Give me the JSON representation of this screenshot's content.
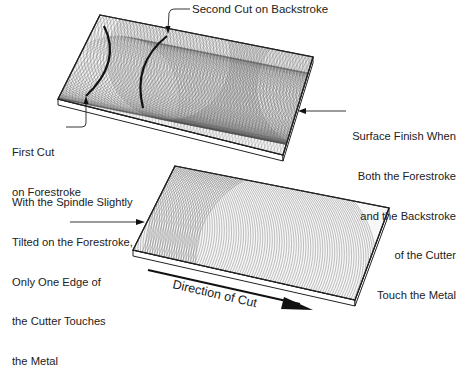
{
  "figure": {
    "top_panel": {
      "labels": {
        "second_cut": "Second Cut on Backstroke",
        "first_cut": [
          "First Cut",
          "on Forestroke"
        ],
        "surface_finish": [
          "Surface Finish When",
          "Both the Forestroke",
          "and the Backstroke",
          "of the Cutter",
          "Touch the Metal"
        ]
      }
    },
    "bottom_panel": {
      "labels": {
        "tilted_spindle": [
          "With the Spindle Slightly",
          "Tilted on the Forestroke,",
          "Only One Edge of",
          "the Cutter Touches",
          "the Metal"
        ],
        "direction": "Direction of Cut"
      }
    },
    "colors": {
      "line": "#222222",
      "hatch": "#555555",
      "background": "#ffffff"
    }
  }
}
